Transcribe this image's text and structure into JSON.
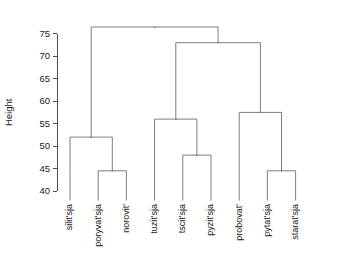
{
  "chart_data": {
    "type": "dendrogram",
    "title": "",
    "xlabel": "",
    "ylabel": "Height",
    "ylim": [
      38.0,
      78.5
    ],
    "yticks": [
      40,
      45,
      50,
      55,
      60,
      65,
      70,
      75
    ],
    "ytick_labels": [
      "40",
      "45",
      "50",
      "55",
      "60",
      "65",
      "70",
      "75"
    ],
    "grid": false,
    "legend": "none",
    "leaves": [
      {
        "label": "silit'sja",
        "order": 1
      },
      {
        "label": "poryvat'sja",
        "order": 2
      },
      {
        "label": "norovit'",
        "order": 3
      },
      {
        "label": "tuzit'sja",
        "order": 4
      },
      {
        "label": "tscit'sja",
        "order": 5
      },
      {
        "label": "pyzit'sja",
        "order": 6
      },
      {
        "label": "probovat'",
        "order": 7
      },
      {
        "label": "pytat'sja",
        "order": 8
      },
      {
        "label": "starat'sja",
        "order": 9
      }
    ],
    "merges": [
      {
        "id": "m1",
        "height": 44.5,
        "children": [
          "poryvat'sja",
          "norovit'"
        ]
      },
      {
        "id": "m2",
        "height": 52.0,
        "children": [
          "silit'sja",
          "m1"
        ]
      },
      {
        "id": "m3",
        "height": 48.0,
        "children": [
          "tscit'sja",
          "pyzit'sja"
        ]
      },
      {
        "id": "m4",
        "height": 56.0,
        "children": [
          "tuzit'sja",
          "m3"
        ]
      },
      {
        "id": "m5",
        "height": 44.5,
        "children": [
          "pytat'sja",
          "starat'sja"
        ]
      },
      {
        "id": "m6",
        "height": 57.5,
        "children": [
          "probovat'",
          "m5"
        ]
      },
      {
        "id": "m7",
        "height": 73.0,
        "children": [
          "m4",
          "m6"
        ]
      },
      {
        "id": "m8",
        "height": 76.5,
        "children": [
          "m2",
          "m7"
        ]
      }
    ],
    "line_color": "#6e6e6e",
    "axis_color": "#3a3a3a",
    "background": "#ffffff"
  }
}
